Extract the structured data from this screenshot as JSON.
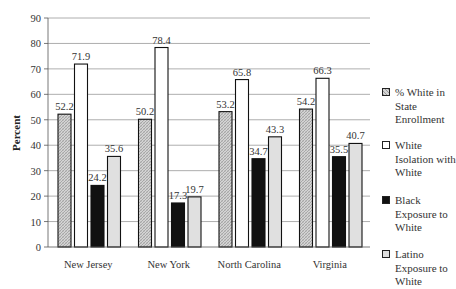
{
  "chart_data": {
    "type": "bar",
    "title": "",
    "xlabel": "",
    "ylabel": "Percent",
    "ylim": [
      0,
      90
    ],
    "yticks": [
      0,
      10,
      20,
      30,
      40,
      50,
      60,
      70,
      80,
      90
    ],
    "grid": true,
    "legend_position": "right",
    "categories": [
      "New Jersey",
      "New York",
      "North Carolina",
      "Virginia"
    ],
    "series": [
      {
        "name": "% White in State Enrollment",
        "values": [
          52.2,
          50.2,
          53.2,
          54.2
        ],
        "fill": "hatched",
        "color": "#c8c8c8"
      },
      {
        "name": "White Isolation with White",
        "values": [
          71.9,
          78.4,
          65.8,
          66.3
        ],
        "fill": "solid",
        "color": "#ffffff"
      },
      {
        "name": "Black Exposure to White",
        "values": [
          24.2,
          17.3,
          34.7,
          35.5
        ],
        "fill": "solid",
        "color": "#111111"
      },
      {
        "name": "Latino Exposure to White",
        "values": [
          35.6,
          19.7,
          43.3,
          40.7
        ],
        "fill": "solid",
        "color": "#e0e0e0"
      }
    ],
    "data_labels": true
  },
  "legend": {
    "items": [
      {
        "label": "% White in State Enrollment"
      },
      {
        "label": "White Isolation with White"
      },
      {
        "label": "Black Exposure to White"
      },
      {
        "label": "Latino Exposure to White"
      }
    ]
  }
}
